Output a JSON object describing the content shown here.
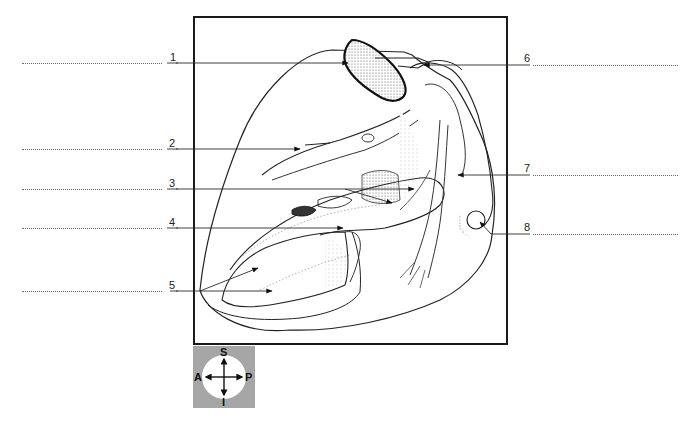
{
  "diagram": {
    "labels": [
      {
        "number": "1",
        "side": "left"
      },
      {
        "number": "2",
        "side": "left"
      },
      {
        "number": "3",
        "side": "left"
      },
      {
        "number": "4",
        "side": "left"
      },
      {
        "number": "5",
        "side": "left"
      },
      {
        "number": "6",
        "side": "right"
      },
      {
        "number": "7",
        "side": "right"
      },
      {
        "number": "8",
        "side": "right"
      }
    ],
    "compass": {
      "superior": "S",
      "inferior": "I",
      "anterior": "A",
      "posterior": "P"
    },
    "colors": {
      "frame": "#1a1a1a",
      "compass_bg": "#a6a6a6",
      "leader": "#2a2a2a",
      "answer_line": "#6b6b6b"
    }
  }
}
